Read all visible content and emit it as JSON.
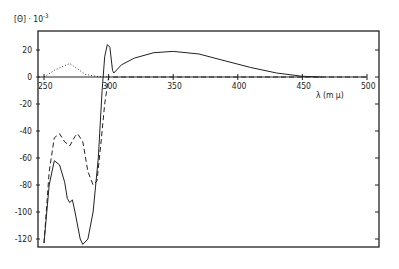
{
  "chart_data": {
    "type": "line",
    "title": "",
    "ylabel": "[Θ] · 10^-3",
    "xlabel": "λ (m μ)",
    "xlim": [
      248,
      500
    ],
    "ylim": [
      -128,
      32
    ],
    "x_ticks": [
      250,
      300,
      350,
      400,
      450,
      500
    ],
    "y_ticks": [
      20,
      0,
      -20,
      -40,
      -60,
      -80,
      -100,
      -120
    ],
    "grid": false,
    "legend": null,
    "series": [
      {
        "name": "solid",
        "style": "solid",
        "points": [
          [
            250,
            -123
          ],
          [
            254,
            -80
          ],
          [
            258,
            -62
          ],
          [
            262,
            -65
          ],
          [
            266,
            -78
          ],
          [
            268,
            -90
          ],
          [
            270,
            -93
          ],
          [
            272,
            -91
          ],
          [
            274,
            -100
          ],
          [
            278,
            -120
          ],
          [
            280,
            -124
          ],
          [
            284,
            -120
          ],
          [
            288,
            -100
          ],
          [
            292,
            -60
          ],
          [
            295,
            -10
          ],
          [
            297,
            15
          ],
          [
            299,
            24
          ],
          [
            301,
            22
          ],
          [
            303,
            5
          ],
          [
            304,
            3
          ],
          [
            310,
            9
          ],
          [
            320,
            14
          ],
          [
            335,
            18
          ],
          [
            350,
            19
          ],
          [
            370,
            17
          ],
          [
            390,
            12
          ],
          [
            410,
            7
          ],
          [
            430,
            3
          ],
          [
            450,
            0.5
          ],
          [
            465,
            0
          ]
        ]
      },
      {
        "name": "dashed",
        "style": "dashed",
        "points": [
          [
            250,
            -123
          ],
          [
            254,
            -70
          ],
          [
            258,
            -45
          ],
          [
            262,
            -42
          ],
          [
            266,
            -48
          ],
          [
            270,
            -51
          ],
          [
            274,
            -44
          ],
          [
            276,
            -42
          ],
          [
            280,
            -48
          ],
          [
            284,
            -70
          ],
          [
            288,
            -80
          ],
          [
            291,
            -77
          ],
          [
            294,
            -50
          ],
          [
            297,
            -20
          ],
          [
            300,
            0
          ],
          [
            310,
            0
          ],
          [
            500,
            0
          ]
        ]
      },
      {
        "name": "dotted",
        "style": "dotted",
        "points": [
          [
            250,
            0
          ],
          [
            258,
            5
          ],
          [
            265,
            8
          ],
          [
            270,
            10
          ],
          [
            276,
            6
          ],
          [
            282,
            2
          ],
          [
            290,
            0.5
          ],
          [
            300,
            0
          ]
        ]
      }
    ]
  },
  "labels": {
    "y_title": "[Θ] · 10",
    "y_exp": "-3",
    "x_title": "λ (m μ)",
    "x_ticks": [
      "250",
      "300",
      "350",
      "400",
      "450",
      "500"
    ],
    "y_ticks": [
      "20",
      "0",
      "-20",
      "-40",
      "-60",
      "-80",
      "-100",
      "-120"
    ]
  }
}
